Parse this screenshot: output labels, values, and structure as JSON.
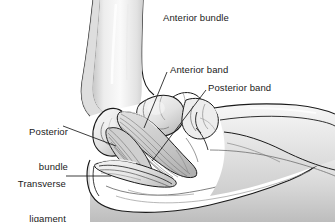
{
  "figure": {
    "background_color": "#ffffff",
    "line_color": "#1a1a1a",
    "bone_fill_light": "#f2f2f2",
    "bone_fill_mid": "#dcdcdc",
    "shadow_fill": "#b8b8b8",
    "ligament_fill": "#c9c9c9",
    "fiber_color": "#6e6e6e"
  },
  "labels": {
    "anterior_bundle": {
      "text": "Anterior bundle",
      "x": 163,
      "y": 13
    },
    "anterior_band": {
      "text": "Anterior band",
      "x": 170,
      "y": 65
    },
    "posterior_band": {
      "text": "Posterior band",
      "x": 208,
      "y": 83
    },
    "posterior_bundle": {
      "line1": "Posterior",
      "line2": "bundle",
      "x": 16,
      "y": 104
    },
    "transverse_ligament": {
      "line1": "Transverse",
      "line2": "ligament",
      "x": 15,
      "y": 156
    }
  },
  "leader_lines": [
    {
      "name": "anterior-band-leader",
      "x1": 167,
      "y1": 72,
      "x2": 144,
      "y2": 128
    },
    {
      "name": "posterior-band-leader",
      "x1": 206,
      "y1": 90,
      "x2": 152,
      "y2": 160
    },
    {
      "name": "posterior-bundle-leader",
      "x1": 63,
      "y1": 126,
      "x2": 115,
      "y2": 145
    },
    {
      "name": "transverse-ligament-leader",
      "x1": 66,
      "y1": 176,
      "x2": 110,
      "y2": 176
    }
  ]
}
